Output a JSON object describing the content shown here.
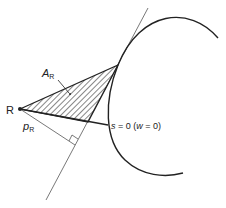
{
  "diagram": {
    "point_label": "R",
    "area_label": {
      "main": "A",
      "sub": "R"
    },
    "distance_label": {
      "main": "p",
      "sub": "R"
    },
    "curve_label": {
      "s": "s",
      "eq1": " = 0 (",
      "w": "w",
      "eq2": " = 0)"
    },
    "colors": {
      "stroke": "#222222",
      "thin_stroke": "#555555",
      "background": "#ffffff"
    }
  }
}
